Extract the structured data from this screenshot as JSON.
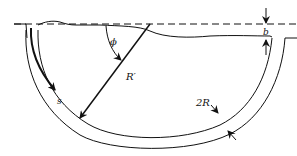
{
  "diagram": {
    "labels": {
      "phi": "ϕ",
      "r_prime": "R′",
      "two_r": "2R",
      "b": "b",
      "s": "s"
    },
    "colors": {
      "stroke": "#111111",
      "background": "#ffffff"
    },
    "elements": [
      "dashed reference line",
      "wavy liquid surface",
      "curved tube (semicircular annulus)",
      "radius arrow R′",
      "angle arc ϕ",
      "path arrow s along tube",
      "thickness marker 2R",
      "gap marker b"
    ]
  }
}
